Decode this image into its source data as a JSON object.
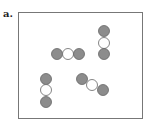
{
  "panel": {
    "label": "a."
  },
  "colors": {
    "outer_atom_fill": "#8c8c8c",
    "center_atom_fill": "#ffffff",
    "atom_stroke": "#666666",
    "frame_stroke": "#777777"
  },
  "molecules": [
    {
      "name": "horizontal",
      "atoms": [
        {
          "cx": 57,
          "cy": 54,
          "type": "outer"
        },
        {
          "cx": 68,
          "cy": 54,
          "type": "center"
        },
        {
          "cx": 79,
          "cy": 54,
          "type": "outer"
        }
      ]
    },
    {
      "name": "vertical-top-right",
      "atoms": [
        {
          "cx": 104,
          "cy": 31,
          "type": "outer"
        },
        {
          "cx": 104,
          "cy": 43,
          "type": "center"
        },
        {
          "cx": 104,
          "cy": 54,
          "type": "outer"
        }
      ]
    },
    {
      "name": "vertical-bottom-left",
      "atoms": [
        {
          "cx": 46,
          "cy": 79,
          "type": "outer"
        },
        {
          "cx": 46,
          "cy": 90,
          "type": "center"
        },
        {
          "cx": 46,
          "cy": 102,
          "type": "outer"
        }
      ]
    },
    {
      "name": "diagonal",
      "atoms": [
        {
          "cx": 82,
          "cy": 79,
          "type": "outer"
        },
        {
          "cx": 92,
          "cy": 85,
          "type": "center"
        },
        {
          "cx": 103,
          "cy": 90,
          "type": "outer"
        }
      ]
    }
  ],
  "atom_radius": 5.5
}
